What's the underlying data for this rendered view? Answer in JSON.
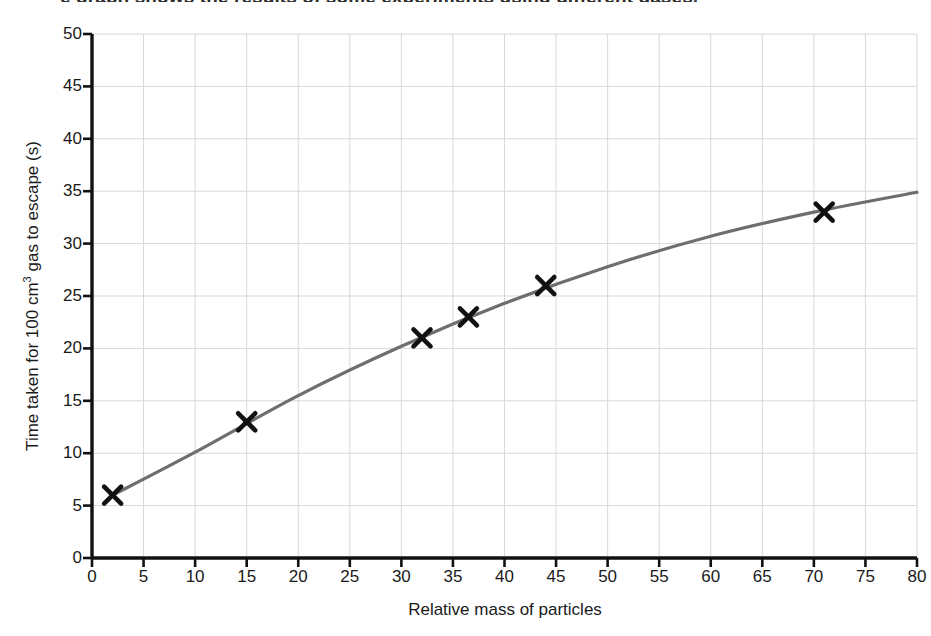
{
  "figure": {
    "clipped_title": "e graph shows the results of some experiments using different gases.",
    "background": "#ffffff"
  },
  "chart_data": {
    "type": "line",
    "title": "",
    "xlabel": "Relative mass of particles",
    "ylabel": "Time taken for 100 cm3 gas to escape (s)",
    "ylabel_parts": {
      "before_sup": "Time taken for 100 cm",
      "sup": "3",
      "after_sup": " gas to escape (s)"
    },
    "xlim": [
      0,
      80
    ],
    "ylim": [
      0,
      50
    ],
    "xticks": [
      0,
      5,
      10,
      15,
      20,
      25,
      30,
      35,
      40,
      45,
      50,
      55,
      60,
      65,
      70,
      75,
      80
    ],
    "yticks": [
      0,
      5,
      10,
      15,
      20,
      25,
      30,
      35,
      40,
      45,
      50
    ],
    "grid": true,
    "grid_color": "#d8d8dc",
    "axis_color": "#111111",
    "legend": null,
    "series": [
      {
        "name": "measured points",
        "marker": "x",
        "marker_color": "#111111",
        "x": [
          2,
          15,
          32,
          36.5,
          44,
          71
        ],
        "values": [
          6,
          13,
          21,
          23,
          26,
          33
        ]
      },
      {
        "name": "best fit curve",
        "marker": "none",
        "line_color": "#6e6e6e",
        "x": [
          2,
          10,
          20,
          30,
          40,
          50,
          60,
          70,
          80
        ],
        "values": [
          6,
          10.1,
          15.5,
          20.2,
          24.3,
          27.8,
          30.7,
          33.0,
          34.9
        ]
      }
    ]
  }
}
